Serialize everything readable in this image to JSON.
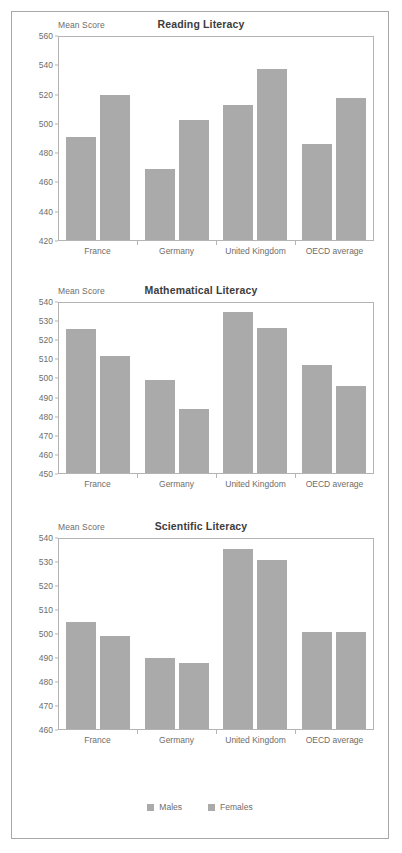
{
  "legend": {
    "items": [
      {
        "label": "Males",
        "color": "#aaaaaa"
      },
      {
        "label": "Females",
        "color": "#aaaaaa"
      }
    ]
  },
  "chart_data": [
    {
      "type": "bar",
      "title": "Reading Literacy",
      "ylabel": "Mean Score",
      "xlabel": "",
      "categories": [
        "France",
        "Germany",
        "United Kingdom",
        "OECD average"
      ],
      "series": [
        {
          "name": "Males",
          "values": [
            491,
            469,
            513,
            486
          ]
        },
        {
          "name": "Females",
          "values": [
            520,
            503,
            538,
            518
          ]
        }
      ],
      "ylim": [
        420,
        560
      ],
      "yticks": [
        420,
        440,
        460,
        480,
        500,
        520,
        540,
        560
      ],
      "grid": false,
      "legend_position": "bottom"
    },
    {
      "type": "bar",
      "title": "Mathematical Literacy",
      "ylabel": "Mean Score",
      "xlabel": "",
      "categories": [
        "France",
        "Germany",
        "United Kingdom",
        "OECD average"
      ],
      "series": [
        {
          "name": "Males",
          "values": [
            526,
            499,
            535,
            507
          ]
        },
        {
          "name": "Females",
          "values": [
            512,
            484,
            527,
            496
          ]
        }
      ],
      "ylim": [
        450,
        540
      ],
      "yticks": [
        450,
        460,
        470,
        480,
        490,
        500,
        510,
        520,
        530,
        540
      ],
      "grid": false,
      "legend_position": "bottom"
    },
    {
      "type": "bar",
      "title": "Scientific Literacy",
      "ylabel": "Mean Score",
      "xlabel": "",
      "categories": [
        "France",
        "Germany",
        "United Kingdom",
        "OECD average"
      ],
      "series": [
        {
          "name": "Males",
          "values": [
            505,
            490,
            536,
            501
          ]
        },
        {
          "name": "Females",
          "values": [
            499,
            488,
            531,
            501
          ]
        }
      ],
      "ylim": [
        460,
        540
      ],
      "yticks": [
        460,
        470,
        480,
        490,
        500,
        510,
        520,
        530,
        540
      ],
      "grid": false,
      "legend_position": "bottom"
    }
  ]
}
